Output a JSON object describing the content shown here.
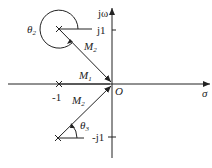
{
  "diagram": {
    "type": "s-plane pole-zero vector diagram",
    "axes": {
      "vertical_label": "jω",
      "horizontal_label": "σ",
      "origin_label": "O",
      "ticks": {
        "j1": "j1",
        "neg_j1": "-j1",
        "neg_1": "-1"
      }
    },
    "poles": [
      {
        "name": "pole-upper",
        "location": "-1+j1"
      },
      {
        "name": "pole-real",
        "location": "-1"
      },
      {
        "name": "pole-lower",
        "location": "-1-j1"
      }
    ],
    "vectors": {
      "M1": {
        "main": "M",
        "sub": "1"
      },
      "M2_upper": {
        "main": "M",
        "sub": "2"
      },
      "M2_lower": {
        "main": "M",
        "sub": "2"
      }
    },
    "angles": {
      "theta2": {
        "main": "θ",
        "sub": "2"
      },
      "theta3": {
        "main": "θ",
        "sub": "3"
      }
    }
  }
}
